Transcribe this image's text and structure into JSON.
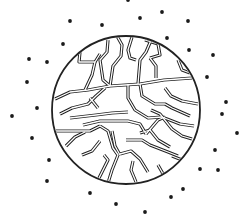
{
  "diagram": {
    "colors": {
      "background": "#ffffff",
      "stroke": "#222222",
      "dot": "#1a1a1a"
    },
    "circle": {
      "cx": 126,
      "cy": 110,
      "r": 74
    },
    "dots": [
      [
        70,
        21
      ],
      [
        102,
        25
      ],
      [
        63,
        44
      ],
      [
        29,
        59
      ],
      [
        47,
        62
      ],
      [
        27,
        82
      ],
      [
        37,
        108
      ],
      [
        12,
        116
      ],
      [
        32,
        138
      ],
      [
        49,
        160
      ],
      [
        47,
        181
      ],
      [
        90,
        193
      ],
      [
        116,
        204
      ],
      [
        145,
        212
      ],
      [
        171,
        197
      ],
      [
        183,
        189
      ],
      [
        200,
        169
      ],
      [
        218,
        170
      ],
      [
        215,
        150
      ],
      [
        237,
        133
      ],
      [
        222,
        114
      ],
      [
        226,
        102
      ],
      [
        207,
        77
      ],
      [
        213,
        55
      ],
      [
        189,
        50
      ],
      [
        167,
        38
      ],
      [
        188,
        21
      ],
      [
        162,
        12
      ],
      [
        140,
        18
      ],
      [
        128,
        0
      ],
      [
        145,
        -2
      ]
    ],
    "channels": [
      "M80,52 L79,62 L95,62 L100,54",
      "M95,62 L92,75 L85,90",
      "M108,40 L107,52 L100,60 L103,80 L110,86",
      "M117,36 L122,45 L121,56 L113,66 L110,86",
      "M55,99 L70,92 L88,90 L110,86 L140,84 L164,80 L192,78",
      "M132,37 L128,50 L130,58 L136,60",
      "M145,40 L158,44 L160,55 L150,58",
      "M150,58 L156,66 L156,78",
      "M128,84 L128,98 L135,110 L148,118 L162,117 L180,124 L194,126",
      "M140,84 L142,96 L155,104 L165,104 L172,108 L190,116",
      "M152,38 L146,52 L140,60 L138,84",
      "M60,114 L72,108 L88,104 L96,96 L105,88",
      "M90,98 L98,108",
      "M70,118 L96,115 L112,113 L128,112",
      "M83,125 L100,121 L128,121 L140,124 L146,134",
      "M56,131 L72,131 L90,131 L100,126",
      "M100,126 L108,131 L113,148 L118,155 L112,170 L108,183",
      "M112,131 L115,146 L120,155",
      "M120,154 L131,151 L140,159 L148,172",
      "M140,133 L150,130 L158,140 L170,147",
      "M146,134 L158,120 L165,117",
      "M66,146 L75,137 L85,132",
      "M82,155 L92,151 L100,141",
      "M104,155 L108,160 L100,176 L97,182",
      "M126,140 L142,140 L150,145 L168,152 L178,156",
      "M151,110 L160,114 L172,129 L182,136 L192,139",
      "M133,161 L131,170 L136,182",
      "M158,165 L162,172 L166,181",
      "M172,156 L182,160 L190,163",
      "M178,60 L182,70 L190,73",
      "M165,88 L171,96 L182,101 L198,104"
    ]
  }
}
